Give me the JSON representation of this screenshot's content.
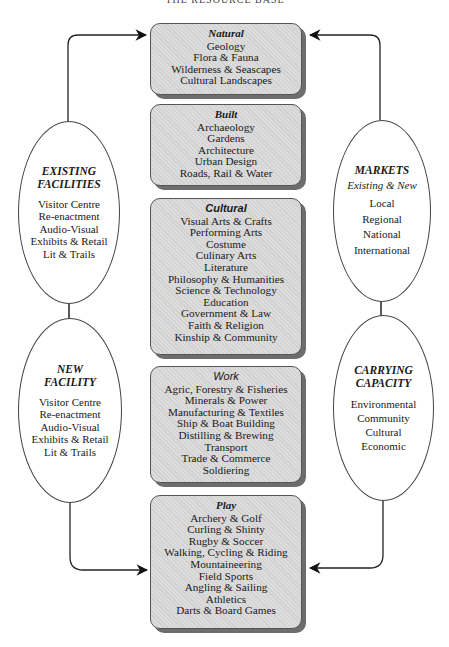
{
  "diagram": {
    "header_partial": "THE RESOURCE BASE",
    "categories": [
      {
        "title": "Natural",
        "items": [
          "Geology",
          "Flora & Fauna",
          "Wilderness & Seascapes",
          "Cultural Landscapes"
        ]
      },
      {
        "title": "Built",
        "items": [
          "Archaeology",
          "Gardens",
          "Architecture",
          "Urban Design",
          "Roads, Rail & Water"
        ]
      },
      {
        "title": "Cultural",
        "items": [
          "Visual Arts & Crafts",
          "Performing Arts",
          "Costume",
          "Culinary Arts",
          "Literature",
          "Philosophy & Humanities",
          "Science & Technology",
          "Education",
          "Government & Law",
          "Faith & Religion",
          "Kinship & Community"
        ]
      },
      {
        "title": "Work",
        "items": [
          "Agric, Forestry & Fisheries",
          "Minerals & Power",
          "Manufacturing & Textiles",
          "Ship & Boat Building",
          "Distilling & Brewing",
          "Transport",
          "Trade & Commerce",
          "Soldiering"
        ]
      },
      {
        "title": "Play",
        "items": [
          "Archery & Golf",
          "Curling & Shinty",
          "Rugby & Soccer",
          "Walking, Cycling & Riding",
          "Mountaineering",
          "Field Sports",
          "Angling & Sailing",
          "Athletics",
          "Darts & Board Games"
        ]
      }
    ],
    "left": [
      {
        "title_line1": "EXISTING",
        "title_line2": "FACILITIES",
        "items": [
          "Visitor Centre",
          "Re-enactment",
          "Audio-Visual",
          "Exhibits & Retail",
          "Lit & Trails"
        ]
      },
      {
        "title_line1": "NEW",
        "title_line2": "FACILITY",
        "items": [
          "Visitor Centre",
          "Re-enactment",
          "Audio-Visual",
          "Exhibits & Retail",
          "Lit & Trails"
        ]
      }
    ],
    "right": [
      {
        "title_line1": "MARKETS",
        "subtitle": "Existing & New",
        "items": [
          "Local",
          "Regional",
          "National",
          "International"
        ]
      },
      {
        "title_line1": "CARRYING",
        "title_line2": "CAPACITY",
        "items": [
          "Environmental",
          "Community",
          "Cultural",
          "Economic"
        ]
      }
    ],
    "colors": {
      "box_fill": "#dcdcdc",
      "box_shadow": "#6d6d6d",
      "line": "#222222",
      "background": "#ffffff"
    }
  }
}
